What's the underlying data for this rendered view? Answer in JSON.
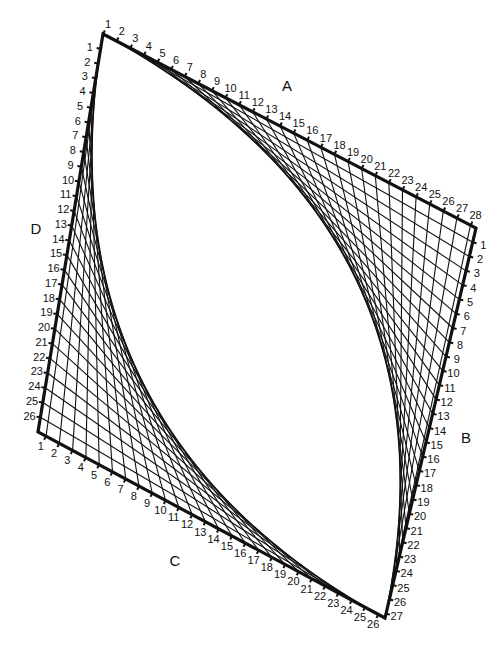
{
  "diagram": {
    "type": "string-art",
    "colors": {
      "background": "#ffffff",
      "ink": "#111111"
    },
    "corners": {
      "top": [
        103,
        34
      ],
      "right": [
        476,
        228
      ],
      "bottom": [
        385,
        618
      ],
      "left": [
        38,
        432
      ]
    },
    "sides": [
      {
        "name": "A",
        "from": "top",
        "to": "right",
        "count": 28,
        "label_pos": [
          287,
          91
        ],
        "label_side": -1
      },
      {
        "name": "B",
        "from": "right",
        "to": "bottom",
        "count": 27,
        "label_pos": [
          466,
          443
        ],
        "label_side": -1
      },
      {
        "name": "C",
        "from": "left",
        "to": "bottom",
        "count": 26,
        "label_pos": [
          175,
          566
        ],
        "label_side": 1
      },
      {
        "name": "D",
        "from": "top",
        "to": "left",
        "count": 26,
        "label_pos": [
          36,
          234
        ],
        "label_side": 1
      }
    ],
    "strings": [
      {
        "from_side": "A",
        "to_side": "B",
        "pairing": "A_n to B_n"
      },
      {
        "from_side": "D",
        "to_side": "C",
        "pairing": "D_n to C_n"
      }
    ]
  }
}
